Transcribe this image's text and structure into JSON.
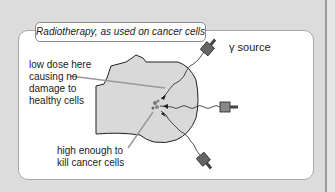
{
  "title": "Radiotherapy, as used on cancer cells",
  "labels": {
    "source": "γ source",
    "low_dose": [
      "low dose here",
      "causing no",
      "damage to",
      "healthy cells"
    ],
    "high_dose": [
      "high enough to",
      "kill cancer cells"
    ]
  },
  "colors": {
    "background": "#dcdcdc",
    "panel": "#ffffff",
    "head_fill": "#d9d9d9",
    "line": "#222222",
    "pointer": "#999999"
  }
}
